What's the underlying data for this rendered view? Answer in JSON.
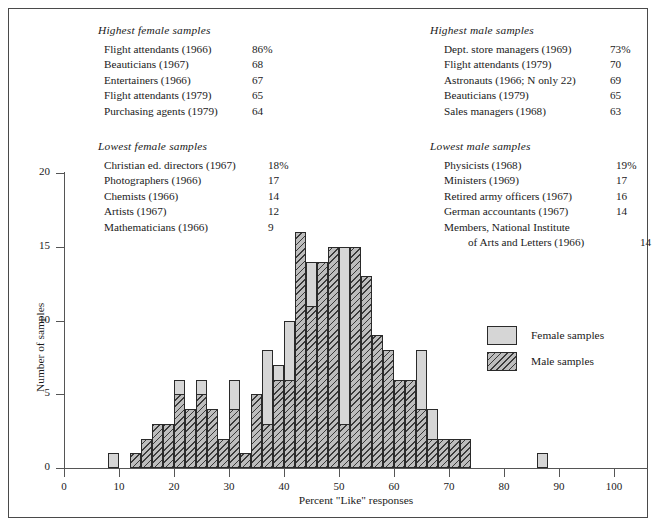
{
  "figure": {
    "axes": {
      "xlabel": "Percent \"Like\" responses",
      "ylabel": "Number of samples",
      "xticks": [
        "0",
        "10",
        "20",
        "30",
        "40",
        "50",
        "60",
        "70",
        "80",
        "90",
        "100"
      ],
      "yticks": [
        "0",
        "5",
        "10",
        "15",
        "20"
      ]
    },
    "legend": {
      "items": [
        {
          "label": "Female samples",
          "style": "solid-gray"
        },
        {
          "label": "Male samples",
          "style": "diagonal-hatch"
        }
      ]
    }
  },
  "lists": [
    {
      "id": "highest-female",
      "title": "Highest female samples",
      "rows": [
        {
          "label": "Flight attendants (1966)",
          "value": "86%"
        },
        {
          "label": "Beauticians (1967)",
          "value": "68"
        },
        {
          "label": "Entertainers (1966)",
          "value": "67"
        },
        {
          "label": "Flight attendants (1979)",
          "value": "65"
        },
        {
          "label": "Purchasing agents (1979)",
          "value": "64"
        }
      ]
    },
    {
      "id": "highest-male",
      "title": "Highest male samples",
      "rows": [
        {
          "label": "Dept. store managers (1969)",
          "value": "73%"
        },
        {
          "label": "Flight attendants (1979)",
          "value": "70"
        },
        {
          "label": "Astronauts (1966; N only 22)",
          "value": "69"
        },
        {
          "label": "Beauticians (1979)",
          "value": "65"
        },
        {
          "label": "Sales managers (1968)",
          "value": "63"
        }
      ]
    },
    {
      "id": "lowest-female",
      "title": "Lowest female samples",
      "rows": [
        {
          "label": "Christian ed. directors (1967)",
          "value": "18%"
        },
        {
          "label": "Photographers (1966)",
          "value": "17"
        },
        {
          "label": "Chemists (1966)",
          "value": "14"
        },
        {
          "label": "Artists (1967)",
          "value": "12"
        },
        {
          "label": "Mathematicians (1966)",
          "value": "9"
        }
      ]
    },
    {
      "id": "lowest-male",
      "title": "Lowest male samples",
      "rows": [
        {
          "label": "Physicists (1968)",
          "value": "19%"
        },
        {
          "label": "Ministers (1969)",
          "value": "17"
        },
        {
          "label": "Retired army  officers (1967)",
          "value": "16"
        },
        {
          "label": "German accountants (1967)",
          "value": "14"
        },
        {
          "label": "Members, National Institute",
          "value": ""
        },
        {
          "label": "of Arts and Letters (1966)",
          "value": "14",
          "continuation": true
        }
      ]
    }
  ],
  "chart_data": {
    "type": "bar",
    "title": "",
    "xlabel": "Percent \"Like\" responses",
    "ylabel": "Number of samples",
    "xlim": [
      0,
      100
    ],
    "ylim": [
      0,
      20
    ],
    "grid": false,
    "bin_width": 2,
    "legend_position": "center-right",
    "overlay": "overlapping",
    "series": [
      {
        "name": "Female samples",
        "color": "#d6d6d6",
        "bins": [
          8,
          12,
          14,
          16,
          18,
          20,
          22,
          24,
          26,
          28,
          30,
          32,
          34,
          36,
          38,
          40,
          42,
          44,
          46,
          48,
          50,
          52,
          54,
          56,
          58,
          60,
          62,
          64,
          66,
          68,
          70,
          86
        ],
        "values": [
          1,
          1,
          2,
          3,
          3,
          6,
          3,
          6,
          3,
          2,
          6,
          1,
          3,
          8,
          7,
          10,
          9,
          14,
          12,
          15,
          15,
          13,
          8,
          7,
          6,
          6,
          2,
          8,
          4,
          2,
          2,
          1
        ]
      },
      {
        "name": "Male samples",
        "color": "hatch",
        "bins": [
          12,
          14,
          16,
          18,
          20,
          22,
          24,
          26,
          28,
          30,
          32,
          34,
          36,
          38,
          40,
          42,
          44,
          46,
          48,
          50,
          52,
          54,
          56,
          58,
          60,
          62,
          64,
          66,
          68,
          70,
          72
        ],
        "values": [
          1,
          2,
          3,
          3,
          5,
          4,
          5,
          4,
          2,
          4,
          1,
          5,
          3,
          6,
          6,
          16,
          11,
          14,
          15,
          3,
          15,
          13,
          9,
          8,
          6,
          6,
          4,
          2,
          2,
          2,
          2
        ]
      }
    ]
  }
}
